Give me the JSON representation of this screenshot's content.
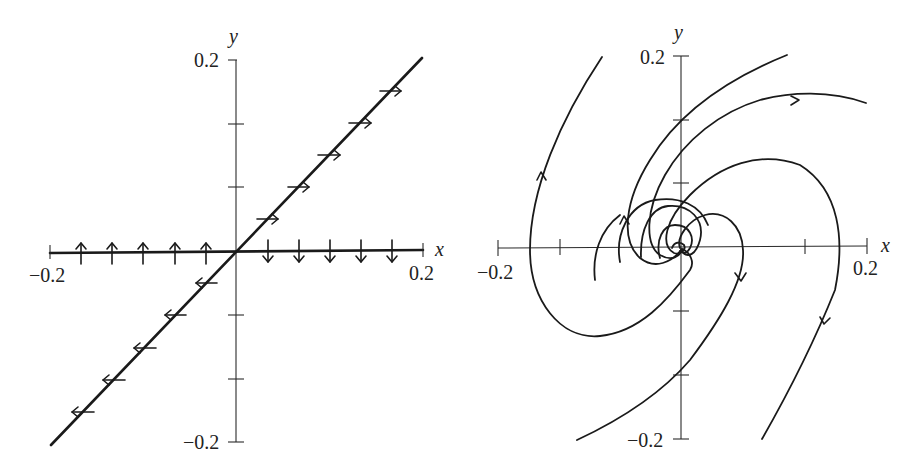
{
  "figure": {
    "panels": [
      {
        "id": "left",
        "description": "Phase portrait with a line of equilibria along y = 0 and an invariant line y = x",
        "x_axis_label": "x",
        "y_axis_label": "y",
        "x_tick_min_label": "−0.2",
        "x_tick_max_label": "0.2",
        "y_tick_max_label": "0.2",
        "y_tick_min_label": "−0.2"
      },
      {
        "id": "right",
        "description": "Phase portrait of a spiral point at the origin; trajectories spiral outward",
        "x_axis_label": "x",
        "y_axis_label": "y",
        "x_tick_min_label": "−0.2",
        "x_tick_max_label": "0.2",
        "y_tick_max_label": "0.2",
        "y_tick_min_label": "−0.2"
      }
    ],
    "axis_range": {
      "x": [
        -0.2,
        0.2
      ],
      "y": [
        -0.2,
        0.2
      ],
      "tick_step": 0.1
    },
    "colors": {
      "ink": "#1a1a1a",
      "background": "#ffffff"
    }
  }
}
